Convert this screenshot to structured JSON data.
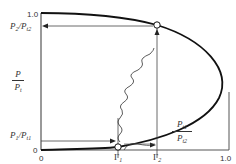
{
  "diagram": {
    "type": "normal-shock pressure ratio curve",
    "y_axis": {
      "label_num": "P",
      "label_den": "P",
      "label_den_sub": "t",
      "ticks": {
        "top": "1.0",
        "bottom": "0"
      },
      "marks": [
        {
          "label": "P",
          "sub": "2",
          "sep": "/P",
          "sub2": "t2"
        },
        {
          "label": "P",
          "sub": "1",
          "sep": "/P",
          "sub2": "t1"
        }
      ]
    },
    "x_axis": {
      "ticks": {
        "left": "0",
        "right": "1.0"
      },
      "marks": [
        {
          "label": "Γ",
          "sub": "1"
        },
        {
          "label": "Γ",
          "sub": "2"
        }
      ]
    },
    "annotation": {
      "num": "P",
      "num_sub": "t1",
      "den": "P",
      "den_sub": "t2"
    }
  },
  "colors": {
    "line": "#111111",
    "axis": "#555555",
    "thin": "#444444"
  }
}
